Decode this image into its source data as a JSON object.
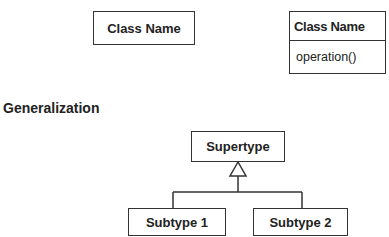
{
  "diagram": {
    "simple_class": {
      "name": "Class Name"
    },
    "class_with_operations": {
      "name": "Class Name",
      "operations": [
        "operation()"
      ]
    },
    "section_title": "Generalization",
    "generalization": {
      "supertype": "Supertype",
      "subtypes": [
        "Subtype 1",
        "Subtype 2"
      ],
      "relationship": "hollow-triangle-arrow"
    }
  }
}
